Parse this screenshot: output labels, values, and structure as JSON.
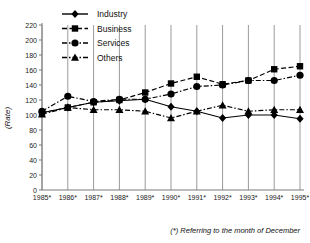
{
  "chart_data": {
    "type": "line",
    "title": "",
    "xlabel": "",
    "ylabel": "(Rate)",
    "ylim": [
      0,
      220
    ],
    "ytick_step": 20,
    "yticks": [
      0,
      20,
      40,
      60,
      80,
      100,
      120,
      140,
      160,
      180,
      200,
      220
    ],
    "grid": "vertical-only",
    "legend_position": "top-center",
    "footnote": "(*) Referring to the month of December",
    "categories": [
      "1985*",
      "1986*",
      "1987*",
      "1988*",
      "1989*",
      "1990*",
      "1991*",
      "1992*",
      "1993*",
      "1994*",
      "1995*"
    ],
    "series": [
      {
        "name": "Industry",
        "marker": "diamond",
        "linestyle": "solid",
        "color": "#000000",
        "values": [
          103,
          110,
          117,
          119,
          121,
          111,
          105,
          96,
          100,
          100,
          95
        ]
      },
      {
        "name": "Business",
        "marker": "square",
        "linestyle": "dashed",
        "color": "#000000",
        "values": [
          103,
          110,
          117,
          120,
          130,
          142,
          151,
          141,
          146,
          161,
          165
        ]
      },
      {
        "name": "Services",
        "marker": "circle",
        "linestyle": "dash-dot",
        "color": "#000000",
        "values": [
          105,
          125,
          118,
          121,
          121,
          128,
          138,
          140,
          146,
          146,
          153
        ]
      },
      {
        "name": "Others",
        "marker": "triangle",
        "linestyle": "dash-dot",
        "color": "#000000",
        "values": [
          101,
          110,
          107,
          107,
          105,
          96,
          105,
          113,
          105,
          107,
          107
        ]
      }
    ]
  },
  "axis": {
    "y_label": "(Rate)"
  },
  "legend": {
    "items": [
      {
        "label": "Industry"
      },
      {
        "label": "Business"
      },
      {
        "label": "Services"
      },
      {
        "label": "Others"
      }
    ]
  },
  "footer": {
    "note": "(*) Referring to the month of December"
  }
}
